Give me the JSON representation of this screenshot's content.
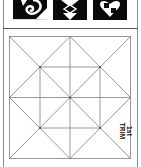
{
  "toolbar": {
    "icons": [
      {
        "name": "swirl-square-icon",
        "label": "pattern-1"
      },
      {
        "name": "diamond-square-icon",
        "label": "pattern-2"
      },
      {
        "name": "checker-heart-square-icon",
        "label": "pattern-3"
      }
    ]
  },
  "diagram": {
    "grid": "square with center cross, diagonals and inner diamond",
    "label_line1": "1st",
    "label_line2": "TRIM",
    "line_color": "#8c8c8c",
    "border_color": "#555555"
  }
}
